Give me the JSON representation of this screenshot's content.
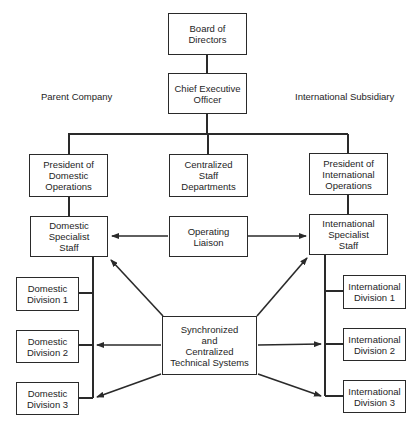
{
  "labels": {
    "parent_company": "Parent Company",
    "international_subsidiary": "International Subsidiary"
  },
  "nodes": {
    "board": "Board of\nDirectors",
    "ceo": "Chief Executive\nOfficer",
    "pres_domestic": "President of\nDomestic\nOperations",
    "central_staff": "Centralized\nStaff\nDepartments",
    "pres_international": "President of\nInternational\nOperations",
    "domestic_specialist": "Domestic\nSpecialist\nStaff",
    "operating_liaison": "Operating\nLiaison",
    "international_specialist": "International\nSpecialist\nStaff",
    "domestic_div1": "Domestic\nDivision 1",
    "domestic_div2": "Domestic\nDivision 2",
    "domestic_div3": "Domestic\nDivision 3",
    "international_div1": "International\nDivision 1",
    "international_div2": "International\nDivision 2",
    "international_div3": "International\nDivision 3",
    "tech_systems": "Synchronized\nand\nCentralized\nTechnical Systems"
  },
  "edges": [
    {
      "from": "board",
      "to": "ceo",
      "type": "line"
    },
    {
      "from": "ceo",
      "to": "pres_domestic",
      "type": "line"
    },
    {
      "from": "ceo",
      "to": "central_staff",
      "type": "line"
    },
    {
      "from": "ceo",
      "to": "pres_international",
      "type": "line"
    },
    {
      "from": "pres_domestic",
      "to": "domestic_specialist",
      "type": "line"
    },
    {
      "from": "pres_international",
      "to": "international_specialist",
      "type": "line"
    },
    {
      "from": "domestic_specialist",
      "to": "domestic_div1",
      "type": "line"
    },
    {
      "from": "domestic_specialist",
      "to": "domestic_div2",
      "type": "line"
    },
    {
      "from": "domestic_specialist",
      "to": "domestic_div3",
      "type": "line"
    },
    {
      "from": "international_specialist",
      "to": "international_div1",
      "type": "line"
    },
    {
      "from": "international_specialist",
      "to": "international_div2",
      "type": "line"
    },
    {
      "from": "international_specialist",
      "to": "international_div3",
      "type": "line"
    },
    {
      "from": "operating_liaison",
      "to": "domestic_specialist",
      "type": "arrow"
    },
    {
      "from": "operating_liaison",
      "to": "international_specialist",
      "type": "arrow"
    },
    {
      "from": "tech_systems",
      "to": "domestic_specialist",
      "type": "arrow"
    },
    {
      "from": "tech_systems",
      "to": "international_specialist",
      "type": "arrow"
    },
    {
      "from": "tech_systems",
      "to": "domestic_div2",
      "type": "arrow"
    },
    {
      "from": "tech_systems",
      "to": "international_div2",
      "type": "arrow"
    },
    {
      "from": "tech_systems",
      "to": "domestic_div3",
      "type": "arrow"
    },
    {
      "from": "tech_systems",
      "to": "international_div3",
      "type": "arrow"
    }
  ],
  "colors": {
    "line": "#2a2a2a",
    "background": "#ffffff"
  }
}
